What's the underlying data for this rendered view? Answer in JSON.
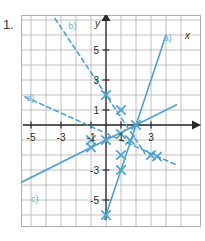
{
  "exercise": {
    "number": "1."
  },
  "colors": {
    "grid": "#b9b9b9",
    "frame": "#b0b0b0",
    "axis": "#2b2b2b",
    "line": "#4ea3cf",
    "label": "#6aaed6",
    "text": "#2b2b2b",
    "background": "#ffffff"
  },
  "chart_data": {
    "type": "line",
    "title": "",
    "xlabel": "x",
    "ylabel": "y",
    "xlim": [
      -6,
      5
    ],
    "ylim": [
      -7,
      7
    ],
    "grid": true,
    "grid_step": 1,
    "x_ticks": [
      -5,
      -3,
      -1,
      1,
      3
    ],
    "x_tick_labels": [
      "-5",
      "-3",
      "-1",
      "1",
      "3"
    ],
    "y_ticks": [
      5,
      3,
      1,
      -3,
      -5
    ],
    "y_tick_labels": [
      "5",
      "3",
      "1",
      "-3",
      "-5"
    ],
    "legend_position": "inline-endpoint-labels",
    "series": [
      {
        "name": "a)",
        "label": "a)",
        "style": "solid",
        "slope": 3,
        "intercept": -6,
        "x_start": -0.1,
        "x_end": 4.0,
        "label_x": 3.85,
        "label_y": 5.6,
        "markers": [
          {
            "x": 0,
            "y": -6
          },
          {
            "x": 1,
            "y": -3
          },
          {
            "x": 1,
            "y": -2
          },
          {
            "x": 2,
            "y": 0
          }
        ]
      },
      {
        "name": "b)",
        "label": "b)",
        "style": "dashed",
        "slope": -1.5,
        "intercept": 2,
        "x_start": -3.4,
        "x_end": 2.6,
        "label_x": -2.5,
        "label_y": 6.4,
        "markers": [
          {
            "x": 0,
            "y": 2
          },
          {
            "x": 1,
            "y": 1
          },
          {
            "x": 1.6,
            "y": -1
          }
        ]
      },
      {
        "name": "c)",
        "label": "c)",
        "style": "solid",
        "slope": 0.5,
        "intercept": -1,
        "x_start": -5.9,
        "x_end": 4.7,
        "label_x": -5.0,
        "label_y": -5.1,
        "markers": [
          {
            "x": -1,
            "y": -1.5
          },
          {
            "x": 0,
            "y": -1
          },
          {
            "x": 1,
            "y": -0.6
          }
        ]
      },
      {
        "name": "d)",
        "label": "d)",
        "style": "dashed",
        "slope": -0.45,
        "intercept": -0.55,
        "x_start": -5.4,
        "x_end": 4.6,
        "label_x": -5.3,
        "label_y": 1.6,
        "markers": [
          {
            "x": -1,
            "y": -1
          },
          {
            "x": 3,
            "y": -2
          },
          {
            "x": 3.4,
            "y": -2.1
          }
        ]
      }
    ],
    "annotations": [
      {
        "text": "a)",
        "x": 3.85,
        "y": 5.6
      },
      {
        "text": "b)",
        "x": -2.5,
        "y": 6.4
      },
      {
        "text": "c)",
        "x": -5.0,
        "y": -5.1
      },
      {
        "text": "d)",
        "x": -5.3,
        "y": 1.6
      }
    ]
  }
}
